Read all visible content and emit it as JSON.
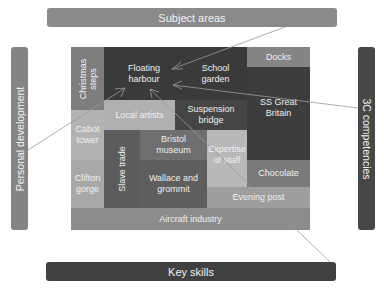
{
  "title_bars": {
    "top": "Subject areas",
    "bottom": "Key skills",
    "left": "Personal development",
    "right": "3C competencies"
  },
  "cells": {
    "christmas_steps": "Christmas steps",
    "floating_harbour": "Floating harbour",
    "school_garden": "School garden",
    "docks": "Docks",
    "local_artists": "Local artists",
    "suspension_bridge": "Suspension bridge",
    "ss_great_britain": "SS Great Britain",
    "cabot_tower": "Cabot tower",
    "clifton_gorge": "Clifton gorge",
    "slave_trade": "Slave trade",
    "bristol_museum": "Bristol museum",
    "wallace_and_grommit": "Wallace and grommit",
    "expertise_of_staff": "Expertise of staff",
    "chocolate": "Chocolate",
    "evening_post": "Evening post",
    "aircraft_industry": "Aircraft industry"
  },
  "colors": {
    "dark": "#3c3c3c",
    "darker": "#333333",
    "medium_dark": "#5a5a5a",
    "medium": "#7a7a7a",
    "light": "#a9a9a9",
    "lighter": "#bdbdbd",
    "bar_light": "#8a8a8a",
    "bar_dark": "#404040"
  }
}
